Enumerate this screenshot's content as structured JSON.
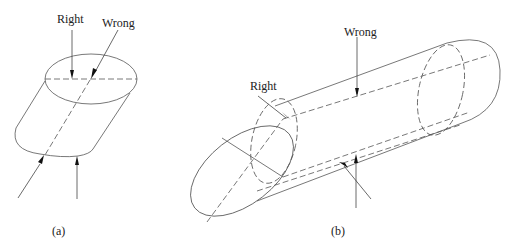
{
  "diagram": {
    "panel_a": {
      "caption": "(a)",
      "labels": {
        "right": "Right",
        "wrong": "Wrong"
      }
    },
    "panel_b": {
      "caption": "(b)",
      "labels": {
        "right": "Right",
        "wrong": "Wrong"
      }
    }
  }
}
